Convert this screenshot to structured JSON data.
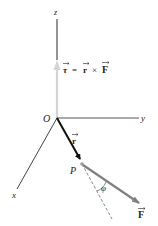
{
  "diagram": {
    "axes": {
      "z_label": "z",
      "y_label": "y",
      "x_label": "x",
      "origin_label": "O"
    },
    "point_label": "P",
    "vectors": {
      "torque": {
        "symbol": "τ",
        "equation_lhs": "τ",
        "equation_eq": "=",
        "equation_r": "r",
        "equation_times": "×",
        "equation_f": "F",
        "color": "#d6d6d6"
      },
      "position": {
        "symbol": "r",
        "color": "#111111"
      },
      "force": {
        "symbol": "F",
        "color": "#808080"
      }
    },
    "angle_label": "φ",
    "colors": {
      "axis": "#555555",
      "z_axis_upper": "#7a7a7a",
      "z_axis_lower": "#cfcfcf",
      "dashed": "#666666"
    }
  }
}
